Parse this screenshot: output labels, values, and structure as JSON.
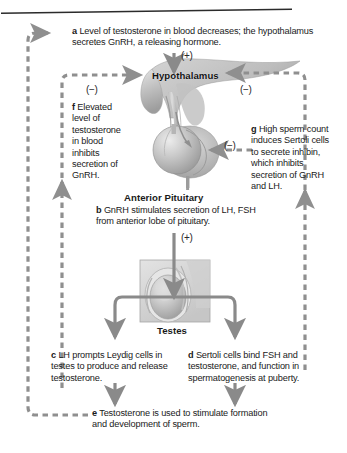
{
  "diagram": {
    "colors": {
      "dashed_arrow": "#8f8f8f",
      "solid_arrow": "#8a8a8a",
      "text": "#1a1a1a",
      "rule": "#2b2b2b",
      "anatomy_light": "#d8d8d8",
      "anatomy_mid": "#b3b3b3",
      "anatomy_dark": "#8d8d8d"
    },
    "structures": [
      {
        "id": "hypothalamus",
        "label": "Hypothalamus"
      },
      {
        "id": "anterior-pituitary",
        "label": "Anterior Pituitary"
      },
      {
        "id": "testes",
        "label": "Testes"
      }
    ],
    "signs": [
      {
        "id": "plus-to-hypothalamus",
        "symbol": "(+)"
      },
      {
        "id": "minus-left-to-hypothalamus",
        "symbol": "(−)"
      },
      {
        "id": "minus-right-to-hypothalamus",
        "symbol": "(−)"
      },
      {
        "id": "minus-to-pituitary",
        "symbol": "(−)"
      },
      {
        "id": "plus-to-testes",
        "symbol": "(+)"
      }
    ],
    "steps": [
      {
        "id": "a",
        "marker": "a",
        "text": "Level of testosterone in blood decreases; the hypothalamus secretes GnRH, a releasing hormone."
      },
      {
        "id": "b",
        "marker": "b",
        "text": "GnRH stimulates secretion of LH, FSH from anterior lobe of pituitary."
      },
      {
        "id": "c",
        "marker": "c",
        "text": "LH prompts Leydig cells in testes to produce and release testosterone."
      },
      {
        "id": "d",
        "marker": "d",
        "text": "Sertoli cells bind FSH and testosterone, and function in spermatogenesis at puberty."
      },
      {
        "id": "e",
        "marker": "e",
        "text": "Testosterone is used to stimulate formation and development of sperm."
      },
      {
        "id": "f",
        "marker": "f",
        "text": "Elevated level of testosterone in blood inhibits secretion of GnRH."
      },
      {
        "id": "g",
        "marker": "g",
        "text": "High sperm count induces Sertoli cells to secrete inhibin, which inhibits secretion of GnRH and LH."
      }
    ]
  }
}
